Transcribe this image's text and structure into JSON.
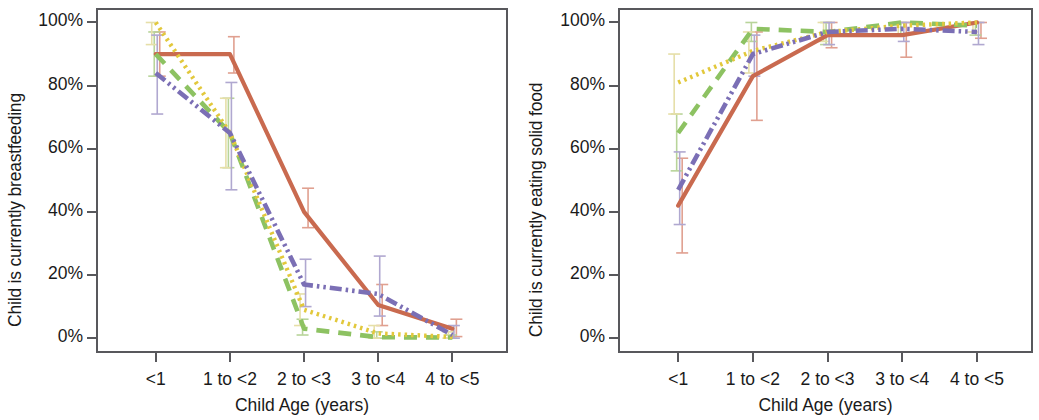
{
  "figure": {
    "panels": [
      "breastfeeding",
      "solid_food"
    ]
  },
  "axis": {
    "xlabel": "Child Age (years)",
    "categories": [
      "<1",
      "1 to <2",
      "2 to <3",
      "3 to <4",
      "4 to <5"
    ],
    "yticklabels": [
      "0%",
      "20%",
      "40%",
      "60%",
      "80%",
      "100%"
    ],
    "ytickvalues": [
      0,
      20,
      40,
      60,
      80,
      100
    ]
  },
  "colors": {
    "series_orange": "#C96A4F",
    "series_green": "#8DC262",
    "series_yellow": "#E2C83C",
    "series_purple": "#7B6FB5",
    "errorbar_orange": "#E0A090",
    "errorbar_green": "#B8D49A",
    "errorbar_yellow": "#E6DFA8",
    "errorbar_purple": "#B0A8D0",
    "axis": "#58585c"
  },
  "chart_data": [
    {
      "type": "line",
      "title": "",
      "ylabel": "Child is currently breastfeeding",
      "xlabel": "Child Age (years)",
      "categories": [
        "<1",
        "1 to <2",
        "2 to <3",
        "3 to <4",
        "4 to <5"
      ],
      "ylim": [
        0,
        100
      ],
      "grid": false,
      "legend": "none",
      "series": [
        {
          "name": "series_orange",
          "style": "solid",
          "color": "#C96A4F",
          "values": [
            90,
            90,
            40,
            10.5,
            3
          ],
          "err_low": [
            83,
            84,
            35,
            4,
            0.5
          ],
          "err_high": [
            97,
            95.5,
            47.5,
            17,
            6
          ]
        },
        {
          "name": "series_green",
          "style": "dashed",
          "color": "#8DC262",
          "values": [
            90,
            65,
            3,
            0.3,
            0.2
          ],
          "err_low": [
            83,
            54,
            1,
            0,
            0
          ],
          "err_high": [
            97,
            76,
            6,
            2,
            1
          ]
        },
        {
          "name": "series_yellow",
          "style": "dotted",
          "color": "#E2C83C",
          "values": [
            100,
            65,
            9,
            1.5,
            0.4
          ],
          "err_low": [
            93,
            54,
            4,
            0,
            0
          ],
          "err_high": [
            100,
            76,
            14,
            4,
            2
          ]
        },
        {
          "name": "series_purple",
          "style": "dashdot",
          "color": "#7B6FB5",
          "values": [
            84,
            65,
            17,
            14,
            1
          ],
          "err_low": [
            71,
            47,
            10,
            7,
            0
          ],
          "err_high": [
            96,
            81,
            25,
            26,
            4
          ]
        }
      ]
    },
    {
      "type": "line",
      "title": "",
      "ylabel": "Child is currently eating solid food",
      "xlabel": "Child Age (years)",
      "categories": [
        "<1",
        "1 to <2",
        "2 to <3",
        "3 to <4",
        "4 to <5"
      ],
      "ylim": [
        0,
        100
      ],
      "grid": false,
      "legend": "none",
      "series": [
        {
          "name": "series_orange",
          "style": "solid",
          "color": "#C96A4F",
          "values": [
            42,
            83,
            96,
            96,
            100
          ],
          "err_low": [
            27,
            69,
            92,
            89,
            95
          ],
          "err_high": [
            57,
            97,
            100,
            100,
            100
          ]
        },
        {
          "name": "series_green",
          "style": "dashed",
          "color": "#8DC262",
          "values": [
            65,
            98,
            97,
            100,
            99
          ],
          "err_low": [
            53,
            94,
            93,
            96,
            96
          ],
          "err_high": [
            71,
            100,
            100,
            100,
            100
          ]
        },
        {
          "name": "series_yellow",
          "style": "dotted",
          "color": "#E2C83C",
          "values": [
            81,
            91,
            97,
            99,
            100
          ],
          "err_low": [
            71,
            84,
            94,
            96,
            97
          ],
          "err_high": [
            90,
            97,
            100,
            100,
            100
          ]
        },
        {
          "name": "series_purple",
          "style": "dashdot",
          "color": "#7B6FB5",
          "values": [
            47,
            90,
            97,
            98,
            97
          ],
          "err_low": [
            36,
            83,
            93,
            94,
            93
          ],
          "err_high": [
            59,
            96,
            100,
            100,
            100
          ]
        }
      ]
    }
  ]
}
